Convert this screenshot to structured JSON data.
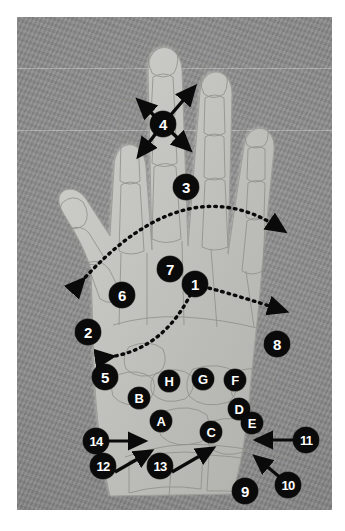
{
  "figure": {
    "plate": {
      "background_color": "#8b8b8b",
      "page_color": "#ffffff",
      "marker_fill": "#0a0a0a",
      "marker_text_color": "#ffffff",
      "x": 17,
      "y": 17,
      "width": 315,
      "height": 493
    },
    "guide_lines": [
      68,
      130
    ]
  },
  "number_markers": [
    {
      "label": "1",
      "x": 195,
      "y": 284,
      "annotation": "dotted-arc-double-arrow"
    },
    {
      "label": "2",
      "x": 88,
      "y": 332,
      "annotation": "none"
    },
    {
      "label": "3",
      "x": 186,
      "y": 187,
      "annotation": "dotted-arc-double-arrow"
    },
    {
      "label": "4",
      "x": 163,
      "y": 124,
      "annotation": "four-way-arrows"
    },
    {
      "label": "5",
      "x": 105,
      "y": 377,
      "annotation": "none"
    },
    {
      "label": "6",
      "x": 122,
      "y": 295,
      "annotation": "none"
    },
    {
      "label": "7",
      "x": 170,
      "y": 269,
      "annotation": "none"
    },
    {
      "label": "8",
      "x": 277,
      "y": 344,
      "annotation": "none"
    },
    {
      "label": "9",
      "x": 245,
      "y": 491,
      "annotation": "none"
    },
    {
      "label": "10",
      "x": 288,
      "y": 485,
      "annotation": "leader-arrow-up-left"
    },
    {
      "label": "11",
      "x": 306,
      "y": 440,
      "annotation": "leader-arrow-left"
    },
    {
      "label": "12",
      "x": 103,
      "y": 466,
      "annotation": "leader-arrow-up-right"
    },
    {
      "label": "13",
      "x": 160,
      "y": 466,
      "annotation": "leader-arrow-up-right"
    },
    {
      "label": "14",
      "x": 96,
      "y": 441,
      "annotation": "leader-arrow-right"
    }
  ],
  "letter_markers": [
    {
      "label": "A",
      "x": 161,
      "y": 421
    },
    {
      "label": "B",
      "x": 139,
      "y": 398
    },
    {
      "label": "C",
      "x": 211,
      "y": 432
    },
    {
      "label": "D",
      "x": 239,
      "y": 409
    },
    {
      "label": "E",
      "x": 252,
      "y": 423
    },
    {
      "label": "F",
      "x": 235,
      "y": 380
    },
    {
      "label": "G",
      "x": 203,
      "y": 379
    },
    {
      "label": "H",
      "x": 169,
      "y": 381
    }
  ],
  "arrows": {
    "arc_3": {
      "start_x": 80,
      "start_y": 280,
      "end_x": 280,
      "end_y": 227,
      "apex_x": 186,
      "apex_y": 187
    },
    "arc_1": {
      "start_x": 108,
      "start_y": 355,
      "end_x": 281,
      "end_y": 308,
      "apex_x": 195,
      "apex_y": 284
    },
    "cross_4": {
      "cx": 163,
      "cy": 124,
      "reach": 30
    }
  }
}
